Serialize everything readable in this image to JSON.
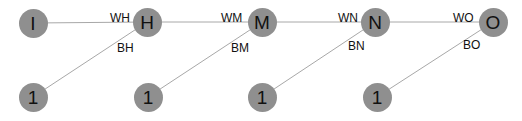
{
  "diagram": {
    "title": "",
    "colors": {
      "node_fill": "#8f8f8f",
      "edge": "#a8a8a8",
      "text": "#111111",
      "background": "#ffffff"
    },
    "nodes": [
      {
        "id": "I",
        "label": "I",
        "x": 33,
        "y": 23,
        "row": "top"
      },
      {
        "id": "H",
        "label": "H",
        "x": 147,
        "y": 22,
        "row": "top"
      },
      {
        "id": "M",
        "label": "M",
        "x": 262,
        "y": 22,
        "row": "top"
      },
      {
        "id": "N",
        "label": "N",
        "x": 375,
        "y": 22,
        "row": "top"
      },
      {
        "id": "O",
        "label": "O",
        "x": 493,
        "y": 22,
        "row": "top"
      },
      {
        "id": "b1",
        "label": "1",
        "x": 33,
        "y": 97,
        "row": "bias"
      },
      {
        "id": "b2",
        "label": "1",
        "x": 148,
        "y": 97,
        "row": "bias"
      },
      {
        "id": "b3",
        "label": "1",
        "x": 262,
        "y": 97,
        "row": "bias"
      },
      {
        "id": "b4",
        "label": "1",
        "x": 377,
        "y": 97,
        "row": "bias"
      }
    ],
    "edges": [
      {
        "from": "I",
        "to": "H",
        "label": "WH",
        "lx": 110,
        "ly": 12
      },
      {
        "from": "H",
        "to": "M",
        "label": "WM",
        "lx": 221,
        "ly": 12
      },
      {
        "from": "M",
        "to": "N",
        "label": "WN",
        "lx": 338,
        "ly": 12
      },
      {
        "from": "N",
        "to": "O",
        "label": "WO",
        "lx": 453,
        "ly": 12
      },
      {
        "from": "b1",
        "to": "H",
        "label": "BH",
        "lx": 117,
        "ly": 42
      },
      {
        "from": "b2",
        "to": "M",
        "label": "BM",
        "lx": 231,
        "ly": 42
      },
      {
        "from": "b3",
        "to": "N",
        "label": "BN",
        "lx": 348,
        "ly": 40
      },
      {
        "from": "b4",
        "to": "O",
        "label": "BO",
        "lx": 463,
        "ly": 39
      }
    ]
  }
}
